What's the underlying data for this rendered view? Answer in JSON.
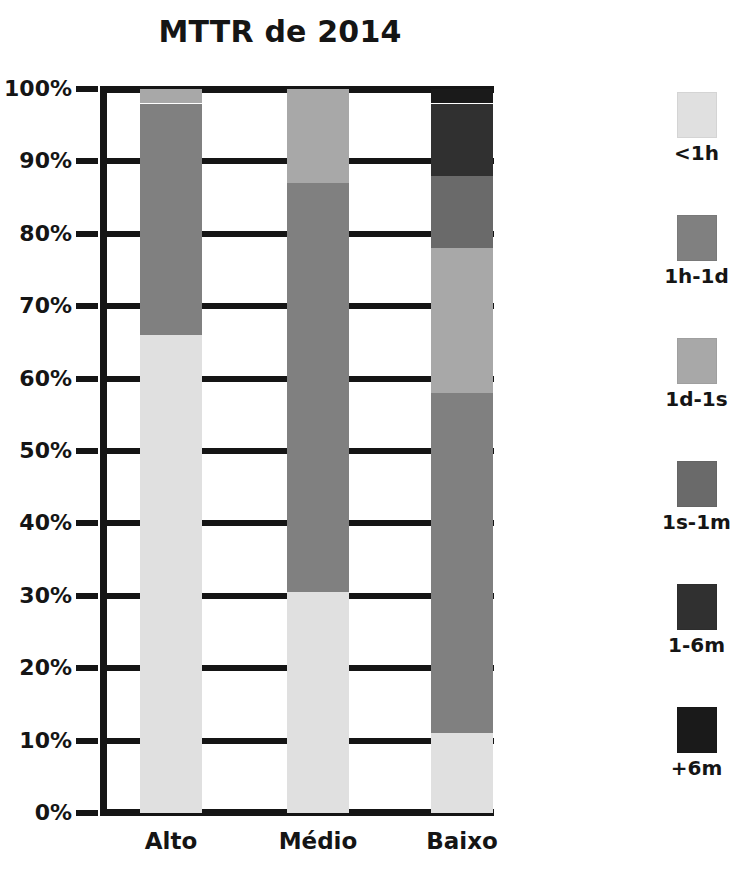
{
  "chart_data": {
    "type": "bar",
    "stacked": true,
    "title": "MTTR de 2014",
    "xlabel": "",
    "ylabel": "",
    "ylim": [
      0,
      100
    ],
    "grid": true,
    "legend_position": "right",
    "categories": [
      "Alto",
      "Médio",
      "Baixo"
    ],
    "ytick_labels": [
      "100%",
      "90%",
      "80%",
      "70%",
      "60%",
      "50%",
      "40%",
      "30%",
      "20%",
      "10%",
      "0%"
    ],
    "ytick_values": [
      100,
      90,
      80,
      70,
      60,
      50,
      40,
      30,
      20,
      10,
      0
    ],
    "series": [
      {
        "name": "<1h",
        "color": "#e0e0e0",
        "values": [
          66,
          30.5,
          11
        ]
      },
      {
        "name": "1h-1d",
        "color": "#808080",
        "values": [
          32,
          56.5,
          47
        ]
      },
      {
        "name": "1d-1s",
        "color": "#a8a8a8",
        "values": [
          2,
          13,
          20
        ]
      },
      {
        "name": "1s-1m",
        "color": "#6a6a6a",
        "values": [
          0,
          0,
          10
        ]
      },
      {
        "name": "1-6m",
        "color": "#303030",
        "values": [
          0,
          0,
          10
        ]
      },
      {
        "name": "+6m",
        "color": "#1a1a1a",
        "values": [
          0,
          0,
          2
        ]
      }
    ],
    "segment_boundaries": {
      "Alto": [
        0,
        2,
        34,
        100
      ],
      "Médio": [
        0,
        13,
        69.5,
        100
      ],
      "Baixo": [
        0,
        2,
        12,
        22,
        42,
        89,
        100
      ]
    }
  },
  "legend": {
    "items": [
      {
        "label": "<1h",
        "color": "#e0e0e0"
      },
      {
        "label": "1h-1d",
        "color": "#808080"
      },
      {
        "label": "1d-1s",
        "color": "#a8a8a8"
      },
      {
        "label": "1s-1m",
        "color": "#6a6a6a"
      },
      {
        "label": "1-6m",
        "color": "#303030"
      },
      {
        "label": "+6m",
        "color": "#1a1a1a"
      }
    ]
  },
  "colors": {
    "axis": "#151515",
    "background": "#ffffff",
    "text": "#151515"
  }
}
